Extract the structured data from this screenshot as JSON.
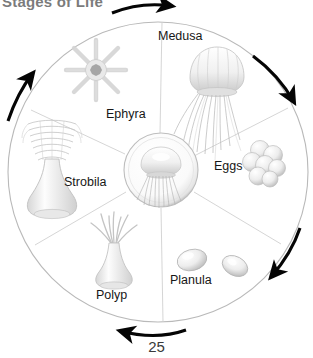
{
  "page": {
    "clipped_header_text": "Stages of Life",
    "page_number": "25",
    "background_color": "#ffffff"
  },
  "diagram": {
    "name": "jellyfish-life-cycle-wheel",
    "center": {
      "icon": "jellyfish-icon",
      "cx": 161,
      "cy": 170,
      "r": 36
    },
    "wheel": {
      "cx": 158,
      "cy": 172,
      "r": 150,
      "stroke": "#b9b9b9"
    },
    "flow_direction": "clockwise",
    "stages": [
      {
        "id": "medusa",
        "label": "Medusa",
        "icon": "medusa-jellyfish-icon",
        "label_x": 158,
        "label_y": 30
      },
      {
        "id": "eggs",
        "label": "Eggs",
        "icon": "egg-cluster-icon",
        "label_x": 214,
        "label_y": 160
      },
      {
        "id": "planula",
        "label": "Planula",
        "icon": "planula-larva-icon",
        "label_x": 170,
        "label_y": 274
      },
      {
        "id": "polyp",
        "label": "Polyp",
        "icon": "polyp-icon",
        "label_x": 96,
        "label_y": 289
      },
      {
        "id": "strobila",
        "label": "Strobila",
        "icon": "strobila-icon",
        "label_x": 64,
        "label_y": 176
      },
      {
        "id": "ephyra",
        "label": "Ephyra",
        "icon": "ephyra-icon",
        "label_x": 106,
        "label_y": 108
      }
    ],
    "arrows": [
      {
        "id": "arrow-top",
        "points_to": "clockwise-right"
      },
      {
        "id": "arrow-upper-right",
        "points_to": "clockwise-down"
      },
      {
        "id": "arrow-lower-right",
        "points_to": "clockwise-down-left"
      },
      {
        "id": "arrow-bottom",
        "points_to": "clockwise-left"
      },
      {
        "id": "arrow-left",
        "points_to": "clockwise-up"
      }
    ],
    "colors": {
      "arrow": "#050505",
      "wheel_outline": "#b9b9b9",
      "spoke": "#cfcfcf",
      "organism_light": "#fbfbfb",
      "organism_mid": "#dcdcdc",
      "organism_shadow": "#9c9c9c",
      "label_text": "#171717"
    }
  }
}
